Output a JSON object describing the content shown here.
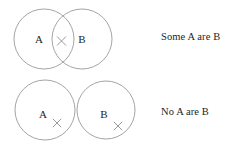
{
  "figure": {
    "type": "euler-diagram-pair",
    "background_color": "#ffffff",
    "stroke_color": "#9a9a9a",
    "text_color": "#1e1e1e"
  },
  "rows": [
    {
      "id": "some-a-are-b",
      "caption": "Some A are B",
      "relation": "overlapping",
      "circles": [
        {
          "label": "A",
          "cx": 44,
          "cy": 39,
          "r": 30,
          "label_x": 39,
          "label_y": 43
        },
        {
          "label": "B",
          "cx": 82,
          "cy": 39,
          "r": 30,
          "label_x": 82,
          "label_y": 43
        }
      ],
      "markers": [
        {
          "name": "x-mark-intersection",
          "x": 61.5,
          "y": 41,
          "size": 4.5
        }
      ]
    },
    {
      "id": "no-a-are-b",
      "caption": "No A are B",
      "relation": "disjoint",
      "circles": [
        {
          "label": "A",
          "cx": 45,
          "cy": 110,
          "r": 30,
          "label_x": 43,
          "label_y": 118
        },
        {
          "label": "B",
          "cx": 106,
          "cy": 110,
          "r": 29,
          "label_x": 104,
          "label_y": 118
        }
      ],
      "markers": [
        {
          "name": "x-mark-outside-a",
          "x": 57,
          "y": 123,
          "size": 4.2
        },
        {
          "name": "x-mark-outside-b",
          "x": 118,
          "y": 126,
          "size": 4.2
        }
      ]
    }
  ],
  "captions": {
    "some": "Some A are B",
    "none": "No A are B"
  },
  "letters": {
    "top_left": "A",
    "top_right": "B",
    "bottom_left": "A",
    "bottom_right": "B"
  }
}
